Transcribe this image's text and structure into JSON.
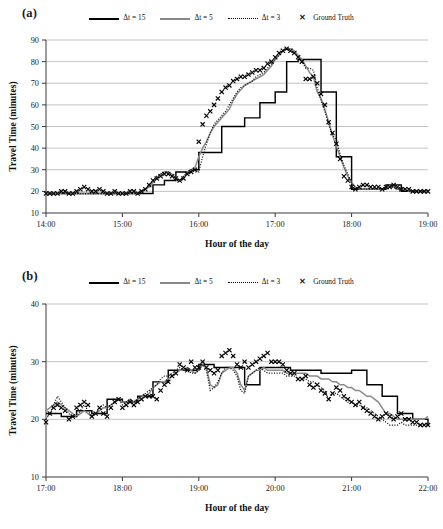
{
  "figure": {
    "panels": [
      {
        "label": "(a)",
        "legend": [
          {
            "key": "solid-black",
            "label": "Δt = 15"
          },
          {
            "key": "solid-gray",
            "label": "Δt = 5"
          },
          {
            "key": "dotted-black",
            "label": "Δt = 3"
          },
          {
            "key": "marker-x",
            "label": "Ground Truth",
            "glyph": "✕"
          }
        ]
      },
      {
        "label": "(b)",
        "legend": [
          {
            "key": "solid-black",
            "label": "Δt = 15"
          },
          {
            "key": "solid-gray",
            "label": "Δt = 5"
          },
          {
            "key": "dotted-black",
            "label": "Δt = 3"
          },
          {
            "key": "marker-x",
            "label": "Ground Truth",
            "glyph": "✕"
          }
        ]
      }
    ]
  },
  "colors": {
    "dt15": "#000000",
    "dt5": "#8a8a8a",
    "dt3": "#151515",
    "ground_truth": "#000000",
    "grid": "#a9a9a9",
    "axis": "#3a3a3a",
    "background": "#ffffff"
  },
  "chart_data": [
    {
      "type": "line",
      "panel": "(a)",
      "title": "",
      "xlabel": "Hour of the day",
      "ylabel": "Travel Time (minutes)",
      "xticklabels": [
        "14:00",
        "15:00",
        "16:00",
        "17:00",
        "18:00",
        "19:00"
      ],
      "xtickvalues": [
        14,
        15,
        16,
        17,
        18,
        19
      ],
      "yticklabels": [
        "10",
        "20",
        "30",
        "40",
        "50",
        "60",
        "70",
        "80",
        "90"
      ],
      "ytickvalues": [
        10,
        20,
        30,
        40,
        50,
        60,
        70,
        80,
        90
      ],
      "xlim": [
        14,
        19
      ],
      "ylim": [
        10,
        90
      ],
      "grid": "horizontal",
      "legend_position": "top-center",
      "x": [
        14.0,
        14.05,
        14.1,
        14.15,
        14.2,
        14.25,
        14.3,
        14.35,
        14.4,
        14.45,
        14.5,
        14.55,
        14.6,
        14.65,
        14.7,
        14.75,
        14.8,
        14.85,
        14.9,
        14.95,
        15.0,
        15.05,
        15.1,
        15.15,
        15.2,
        15.25,
        15.3,
        15.35,
        15.4,
        15.45,
        15.5,
        15.55,
        15.6,
        15.65,
        15.7,
        15.75,
        15.8,
        15.85,
        15.9,
        15.95,
        16.0,
        16.05,
        16.1,
        16.15,
        16.2,
        16.25,
        16.3,
        16.35,
        16.4,
        16.45,
        16.5,
        16.55,
        16.6,
        16.65,
        16.7,
        16.75,
        16.8,
        16.85,
        16.9,
        16.95,
        17.0,
        17.05,
        17.1,
        17.15,
        17.2,
        17.25,
        17.3,
        17.35,
        17.4,
        17.45,
        17.5,
        17.55,
        17.6,
        17.65,
        17.7,
        17.75,
        17.8,
        17.85,
        17.9,
        17.95,
        18.0,
        18.05,
        18.1,
        18.15,
        18.2,
        18.25,
        18.3,
        18.35,
        18.4,
        18.45,
        18.5,
        18.55,
        18.6,
        18.65,
        18.7,
        18.75,
        18.8,
        18.85,
        18.9,
        18.95,
        19.0
      ],
      "series": [
        {
          "name": "Δt = 15",
          "style": "solid",
          "color": "#000000",
          "values": [
            19,
            19,
            19,
            19,
            19,
            19,
            19,
            19,
            19,
            19,
            19,
            19,
            19,
            19,
            19,
            19,
            19,
            19,
            19,
            19,
            19,
            19,
            19,
            19,
            19,
            19,
            19,
            19,
            23,
            23,
            23,
            25,
            25,
            25,
            29,
            29,
            29,
            29,
            30,
            30,
            38,
            38,
            38,
            38,
            38,
            38,
            50,
            50,
            50,
            50,
            50,
            50,
            54,
            54,
            54,
            54,
            61,
            61,
            61,
            61,
            66,
            66,
            66,
            80,
            80,
            80,
            81,
            81,
            81,
            81,
            81,
            81,
            66,
            66,
            66,
            66,
            36,
            36,
            36,
            36,
            21,
            21,
            21,
            21,
            21,
            21,
            21,
            21,
            21,
            23,
            23,
            23,
            23,
            20,
            20,
            20,
            20,
            20,
            20,
            20,
            20
          ]
        },
        {
          "name": "Δt = 5",
          "style": "solid",
          "color": "#8a8a8a",
          "values": [
            19,
            19,
            19,
            19,
            19,
            19,
            19,
            19,
            19,
            19,
            19,
            19,
            19,
            19,
            19,
            19,
            19,
            19,
            19,
            19,
            19,
            19,
            19,
            19,
            19,
            20,
            21,
            22,
            24,
            26,
            28,
            29,
            29,
            28,
            26,
            25,
            26,
            29,
            30,
            31,
            36,
            40,
            43,
            47,
            50,
            52,
            54,
            56,
            58,
            62,
            65,
            67,
            69,
            70,
            71,
            72,
            73,
            74,
            76,
            78,
            81,
            83,
            85,
            86,
            86,
            85,
            83,
            81,
            78,
            75,
            73,
            66,
            63,
            58,
            52,
            46,
            41,
            36,
            31,
            27,
            24,
            22,
            21,
            21,
            21,
            21,
            21,
            21,
            21,
            22,
            22,
            22,
            21,
            21,
            21,
            20,
            20,
            20,
            20,
            20,
            20
          ]
        },
        {
          "name": "Δt = 3",
          "style": "dotted",
          "color": "#151515",
          "values": [
            19,
            19,
            19,
            19,
            19,
            19,
            19,
            19,
            19,
            19,
            19,
            19,
            19,
            19,
            19,
            19,
            19,
            19,
            19,
            19,
            19,
            19,
            19,
            19,
            19,
            20,
            21,
            23,
            25,
            27,
            28,
            29,
            29,
            27,
            25,
            25,
            27,
            29,
            30,
            29,
            29,
            36,
            42,
            47,
            51,
            53,
            55,
            57,
            60,
            63,
            66,
            68,
            69,
            70,
            71,
            73,
            74,
            75,
            77,
            79,
            81,
            83,
            85,
            86,
            85,
            84,
            82,
            80,
            77,
            77,
            76,
            68,
            62,
            57,
            51,
            46,
            44,
            37,
            32,
            28,
            24,
            22,
            21,
            21,
            21,
            21,
            21,
            21,
            21,
            22,
            22,
            22,
            21,
            21,
            21,
            20,
            20,
            20,
            20,
            20,
            20
          ]
        }
      ],
      "ground_truth": {
        "name": "Ground Truth",
        "marker": "x",
        "values": [
          19,
          19,
          19,
          19,
          20,
          20,
          19,
          19,
          20,
          21,
          22,
          21,
          20,
          20,
          21,
          20,
          19,
          19,
          20,
          19,
          19,
          19,
          20,
          20,
          19,
          20,
          21,
          23,
          25,
          26,
          27,
          28,
          28,
          27,
          26,
          25,
          26,
          28,
          29,
          30,
          43,
          51,
          55,
          57,
          60,
          63,
          66,
          68,
          69,
          71,
          72,
          73,
          73,
          74,
          75,
          76,
          76,
          77,
          79,
          80,
          82,
          84,
          85,
          86,
          85,
          84,
          82,
          80,
          72,
          72,
          73,
          70,
          65,
          60,
          52,
          47,
          42,
          35,
          27,
          25,
          22,
          21,
          22,
          23,
          23,
          22,
          22,
          22,
          21,
          22,
          22,
          23,
          22,
          21,
          21,
          21,
          20,
          20,
          20,
          20,
          20
        ]
      }
    },
    {
      "type": "line",
      "panel": "(b)",
      "title": "",
      "xlabel": "Hour of the day",
      "ylabel": "Travel Time (minutes)",
      "xticklabels": [
        "17:00",
        "18:00",
        "19:00",
        "20:00",
        "21:00",
        "22:00"
      ],
      "xtickvalues": [
        17,
        18,
        19,
        20,
        21,
        22
      ],
      "yticklabels": [
        "10",
        "20",
        "30",
        "40"
      ],
      "ytickvalues": [
        10,
        20,
        30,
        40
      ],
      "xlim": [
        17,
        22
      ],
      "ylim": [
        10,
        40
      ],
      "grid": "horizontal",
      "legend_position": "top-center",
      "x": [
        17.0,
        17.05,
        17.1,
        17.15,
        17.2,
        17.25,
        17.3,
        17.35,
        17.4,
        17.45,
        17.5,
        17.55,
        17.6,
        17.65,
        17.7,
        17.75,
        17.8,
        17.85,
        17.9,
        17.95,
        18.0,
        18.05,
        18.1,
        18.15,
        18.2,
        18.25,
        18.3,
        18.35,
        18.4,
        18.45,
        18.5,
        18.55,
        18.6,
        18.65,
        18.7,
        18.75,
        18.8,
        18.85,
        18.9,
        18.95,
        19.0,
        19.05,
        19.1,
        19.15,
        19.2,
        19.25,
        19.3,
        19.35,
        19.4,
        19.45,
        19.5,
        19.55,
        19.6,
        19.65,
        19.7,
        19.75,
        19.8,
        19.85,
        19.9,
        19.95,
        20.0,
        20.05,
        20.1,
        20.15,
        20.2,
        20.25,
        20.3,
        20.35,
        20.4,
        20.45,
        20.5,
        20.55,
        20.6,
        20.65,
        20.7,
        20.75,
        20.8,
        20.85,
        20.9,
        20.95,
        21.0,
        21.05,
        21.1,
        21.15,
        21.2,
        21.25,
        21.3,
        21.35,
        21.4,
        21.45,
        21.5,
        21.55,
        21.6,
        21.65,
        21.7,
        21.75,
        21.8,
        21.85,
        21.9,
        21.95,
        22.0
      ],
      "series": [
        {
          "name": "Δt = 15",
          "style": "solid",
          "color": "#000000",
          "values": [
            21,
            21,
            21,
            21,
            20.5,
            20.5,
            20.5,
            20.5,
            21.5,
            21.5,
            21.5,
            21.5,
            21,
            21,
            21,
            21,
            23.5,
            23.5,
            23.5,
            23.5,
            23,
            23,
            23,
            23,
            24,
            24,
            24,
            24,
            26.5,
            26.5,
            26.5,
            26.5,
            28.5,
            28.5,
            28.5,
            28.5,
            28.5,
            28.5,
            28.5,
            28.5,
            29.5,
            29.5,
            29.5,
            29.5,
            29,
            29,
            29,
            29,
            29,
            29,
            29,
            29,
            26,
            26,
            26,
            26,
            29,
            29,
            29,
            29,
            29,
            29,
            29,
            29,
            28.5,
            28.5,
            28.5,
            28.5,
            28.5,
            28.5,
            28.5,
            28.5,
            28,
            28,
            28,
            28,
            28,
            28,
            28,
            28,
            28.5,
            28.5,
            28.5,
            28.5,
            26,
            26,
            26,
            26,
            24,
            24,
            24,
            24,
            21,
            21,
            21,
            21,
            20,
            20,
            20,
            20,
            19
          ]
        },
        {
          "name": "Δt = 5",
          "style": "solid",
          "color": "#8a8a8a",
          "values": [
            21.5,
            22,
            22.5,
            23,
            22.5,
            22,
            21.5,
            21,
            20.5,
            21,
            21.5,
            21,
            20.5,
            21,
            21.5,
            22,
            22,
            22.5,
            23,
            23.5,
            23,
            23,
            23.5,
            23,
            23.5,
            24,
            24,
            24.5,
            25.5,
            26,
            26.5,
            26.5,
            27,
            27.5,
            28,
            28.5,
            28.5,
            29,
            28.5,
            28,
            28.5,
            29.5,
            29,
            26,
            25.5,
            26,
            28,
            28.5,
            29,
            29,
            28,
            26,
            25,
            27.5,
            28,
            28.5,
            28.5,
            29,
            28.5,
            28.5,
            28.5,
            28.5,
            28.5,
            28,
            28,
            28,
            28,
            28,
            28,
            27.5,
            27.5,
            27.5,
            27,
            27,
            27,
            26.5,
            26.5,
            26,
            26,
            25.5,
            25.5,
            25,
            25,
            24.5,
            24,
            24,
            23.5,
            23,
            22,
            21,
            21,
            20.5,
            20,
            20,
            20,
            20,
            20,
            20,
            20,
            20,
            20.5
          ]
        },
        {
          "name": "Δt = 3",
          "style": "dotted",
          "color": "#151515",
          "values": [
            20,
            21,
            22.5,
            24,
            23,
            22,
            21,
            20.5,
            20.5,
            21.5,
            22.5,
            21.5,
            20.5,
            21,
            22,
            22.5,
            22,
            22.5,
            23,
            23.5,
            22.5,
            23,
            23.5,
            23,
            23.5,
            24,
            24.5,
            25,
            25.5,
            26,
            27,
            27.5,
            27.5,
            28,
            28.5,
            29,
            28.5,
            29,
            28,
            28,
            28.5,
            29.5,
            28.5,
            25,
            25.5,
            26.5,
            28,
            29,
            29,
            28.5,
            27.5,
            25,
            24.5,
            27.5,
            28,
            28.5,
            29,
            28.5,
            28,
            28,
            28,
            28,
            28,
            27.5,
            27.5,
            27.5,
            27,
            27,
            27,
            26.5,
            26.5,
            26,
            25.5,
            25,
            23.5,
            24.5,
            24.5,
            24,
            23.5,
            23,
            23,
            22.5,
            22.5,
            22,
            22,
            21.5,
            21,
            20.5,
            20,
            19.5,
            19,
            19,
            19,
            19.5,
            19,
            19,
            19,
            19,
            19,
            19,
            19
          ]
        }
      ],
      "ground_truth": {
        "name": "Ground Truth",
        "marker": "x",
        "values": [
          19.5,
          21,
          22,
          22.5,
          22,
          21.5,
          20,
          20.5,
          22,
          22.5,
          23,
          22.5,
          20.5,
          21,
          22,
          21,
          20.5,
          22,
          23,
          23.5,
          22,
          22.5,
          23,
          22.5,
          23,
          23.5,
          24,
          24,
          24,
          23.5,
          25,
          26,
          26.5,
          27.5,
          28,
          29.5,
          29,
          28.5,
          30,
          29,
          29,
          30,
          29,
          28.5,
          28,
          28.5,
          31,
          31.5,
          32,
          31,
          29.5,
          29,
          30,
          29,
          29.5,
          30,
          30.5,
          31,
          31.5,
          30,
          30,
          30,
          29.5,
          28.5,
          28,
          28,
          27,
          27,
          27.5,
          26,
          25.5,
          26,
          25,
          24.5,
          23.5,
          24.5,
          25.5,
          25,
          24,
          23.5,
          23,
          22.5,
          23,
          22,
          21.5,
          21,
          20.5,
          20,
          20.5,
          21,
          20.5,
          20,
          20.5,
          21,
          20,
          20,
          19.5,
          19.5,
          19,
          19,
          19
        ]
      }
    }
  ]
}
